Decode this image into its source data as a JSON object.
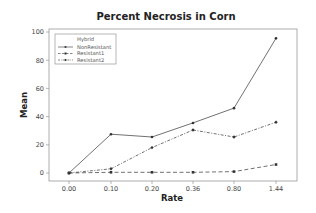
{
  "chart_data": {
    "type": "line",
    "title": "Percent Necrosis in Corn",
    "xlabel": "Rate",
    "ylabel": "Mean",
    "categories": [
      "0.00",
      "0.10",
      "0.20",
      "0.36",
      "0.80",
      "1.44"
    ],
    "series": [
      {
        "name": "NonResistant",
        "values": [
          0,
          27.5,
          25.5,
          35.5,
          46,
          95.5
        ],
        "line_style": "solid",
        "marker": "circle"
      },
      {
        "name": "Resistant1",
        "values": [
          0,
          0.5,
          0.5,
          0.5,
          1,
          6
        ],
        "line_style": "dashed",
        "marker": "square"
      },
      {
        "name": "Resistant2",
        "values": [
          0,
          3,
          18,
          30.5,
          25.5,
          36
        ],
        "line_style": "dashdot",
        "marker": "diamond"
      }
    ],
    "ylim": [
      -5,
      104
    ],
    "yticks": [
      0,
      20,
      40,
      60,
      80,
      100
    ],
    "grid": false,
    "legend": {
      "title": "Hybrid",
      "position": "upper-left-inside"
    },
    "colors": {
      "line": "#333333",
      "frame": "#888888",
      "background": "#ffffff"
    }
  }
}
